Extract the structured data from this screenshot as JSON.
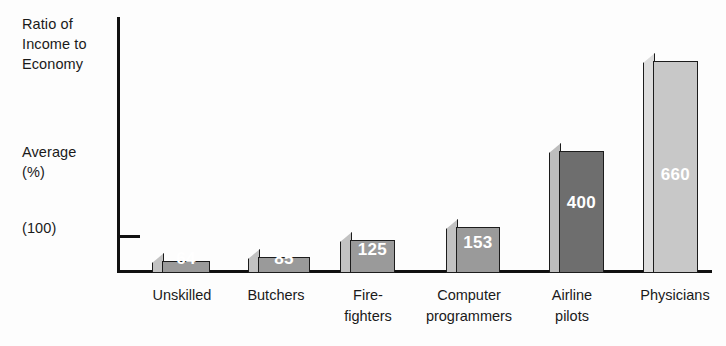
{
  "axis": {
    "title": "Ratio of\nIncome to\nEconomy",
    "average_label": "Average\n(%)",
    "baseline_label": "(100)"
  },
  "chart_data": {
    "type": "bar",
    "title": "Ratio of Income to Economy Average (%)",
    "xlabel": "",
    "ylabel": "Ratio of Income to Economy Average (%)",
    "ylim": [
      0,
      700
    ],
    "grid": false,
    "legend": null,
    "baseline_reference": 100,
    "categories": [
      "Unskilled",
      "Butchers",
      "Fire-\nfighters",
      "Computer\nprogrammers",
      "Airline\npilots",
      "Physicians"
    ],
    "values": [
      64,
      85,
      125,
      153,
      400,
      660
    ],
    "value_labels": [
      "64",
      "85",
      "125",
      "153",
      "400",
      "660"
    ],
    "bar_styles": [
      {
        "front": "#9a9a9a",
        "side": "#c2c2c2"
      },
      {
        "front": "#9a9a9a",
        "side": "#c2c2c2"
      },
      {
        "front": "#9a9a9a",
        "side": "#c2c2c2"
      },
      {
        "front": "#9a9a9a",
        "side": "#c2c2c2"
      },
      {
        "front": "#6e6e6e",
        "side": "#bdbdbd"
      },
      {
        "front": "#c8c8c8",
        "side": "#dcdcdc"
      }
    ],
    "colors": {
      "axis": "#111111",
      "text": "#1a1a1a",
      "value_text": "#ffffff",
      "background": "#fdfdfd"
    }
  },
  "layout": {
    "bars": [
      {
        "left": 152,
        "side_w": 12,
        "front_w": 48,
        "height": 20,
        "label_y": 4
      },
      {
        "left": 248,
        "side_w": 12,
        "front_w": 52,
        "height": 24,
        "label_y": 4
      },
      {
        "left": 340,
        "side_w": 12,
        "front_w": 45,
        "height": 41,
        "label_y": 13
      },
      {
        "left": 446,
        "side_w": 12,
        "front_w": 44,
        "height": 54,
        "label_y": 20
      },
      {
        "left": 549,
        "side_w": 12,
        "front_w": 45,
        "height": 130,
        "label_y": 60
      },
      {
        "left": 643,
        "side_w": 12,
        "front_w": 45,
        "height": 220,
        "label_y": 88
      }
    ],
    "cat_labels": [
      {
        "left": 137,
        "width": 90
      },
      {
        "left": 233,
        "width": 86
      },
      {
        "left": 328,
        "width": 80
      },
      {
        "left": 414,
        "width": 110
      },
      {
        "left": 532,
        "width": 80
      },
      {
        "left": 626,
        "width": 98
      }
    ]
  }
}
